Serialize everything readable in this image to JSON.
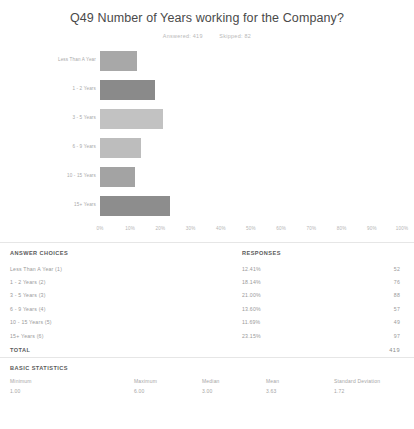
{
  "header": {
    "title": "Q49 Number of Years working for the Company?",
    "answered_label": "Answered: 419",
    "skipped_label": "Skipped: 82"
  },
  "chart_data": {
    "type": "bar",
    "orientation": "horizontal",
    "title": "Q49 Number of Years working for the Company?",
    "xlabel": "",
    "ylabel": "",
    "xlim": [
      0,
      100
    ],
    "grid": false,
    "legend": false,
    "categories": [
      "Less Than A Year",
      "1 - 2 Years",
      "3 - 5 Years",
      "6 - 9 Years",
      "10 - 15 Years",
      "15+ Years"
    ],
    "values": [
      12.41,
      18.14,
      21.0,
      13.6,
      11.69,
      23.15
    ],
    "counts": [
      52,
      76,
      88,
      57,
      49,
      97
    ],
    "xticks": [
      "0%",
      "10%",
      "20%",
      "30%",
      "40%",
      "50%",
      "60%",
      "70%",
      "80%",
      "90%",
      "100%"
    ],
    "xtick_values": [
      0,
      10,
      20,
      30,
      40,
      50,
      60,
      70,
      80,
      90,
      100
    ],
    "bar_colors": [
      "#a8a8a8",
      "#8a8a8a",
      "#c2c2c2",
      "#bdbdbd",
      "#a3a3a3",
      "#8d8d8d"
    ]
  },
  "answer_table": {
    "col_choices": "ANSWER CHOICES",
    "col_responses": "RESPONSES",
    "rows": [
      {
        "choice": "Less Than A Year (1)",
        "pct": "12.41%",
        "count": "52"
      },
      {
        "choice": "1 - 2 Years (2)",
        "pct": "18.14%",
        "count": "76"
      },
      {
        "choice": "3 - 5 Years (3)",
        "pct": "21.00%",
        "count": "88"
      },
      {
        "choice": "6 - 9 Years (4)",
        "pct": "13.60%",
        "count": "57"
      },
      {
        "choice": "10 - 15 Years (5)",
        "pct": "11.69%",
        "count": "49"
      },
      {
        "choice": "15+ Years (6)",
        "pct": "23.15%",
        "count": "97"
      }
    ],
    "total_label": "TOTAL",
    "total_value": "419"
  },
  "basic_statistics": {
    "heading": "BASIC STATISTICS",
    "items": [
      {
        "label": "Minimum",
        "value": "1.00"
      },
      {
        "label": "Maximum",
        "value": "6.00"
      },
      {
        "label": "Median",
        "value": "3.00"
      },
      {
        "label": "Mean",
        "value": "3.63"
      },
      {
        "label": "Standard Deviation",
        "value": "1.72"
      }
    ]
  }
}
